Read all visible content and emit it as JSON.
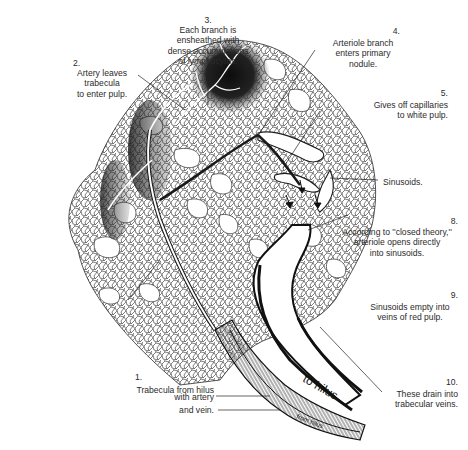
{
  "figure": {
    "colors": {
      "ink": "#1e1e1e",
      "paper": "#ffffff",
      "nodule": "#141414"
    }
  },
  "labels": [
    {
      "number": "1.",
      "text": "Trabecula from hilus"
    },
    {
      "number": "",
      "text": "with artery"
    },
    {
      "number": "",
      "text": "and vein."
    },
    {
      "number": "2.",
      "text": "Artery leaves trabecula\nto enter pulp."
    },
    {
      "number": "3.",
      "text": "Each branch is\nensheathed with\ndense accumulations\nof lymphocytes."
    },
    {
      "number": "4.",
      "text": "Arteriole branch\nenters primary\nnodule."
    },
    {
      "number": "5.",
      "text": "Gives off capillaries\nto white pulp."
    },
    {
      "number": "6.",
      "text": "Arteriole continues on\nto enter red pulp."
    },
    {
      "number": "7.",
      "text": "According to ''open theory,''\narteriole opens into mesh\n(pulp cords) between\nsinusoids."
    },
    {
      "number": "",
      "text": "Sinusoids."
    },
    {
      "number": "8.",
      "text": "According to ''closed theory,''\narteriole opens directly\ninto sinusoids."
    },
    {
      "number": "9.",
      "text": "Sinusoids empty into\nveins of red pulp."
    },
    {
      "number": "10.",
      "text": "These drain into\ntrabecular veins."
    }
  ],
  "vessel_labels": {
    "to_hilus": "to hilus",
    "from_hilus": "from hilus"
  }
}
